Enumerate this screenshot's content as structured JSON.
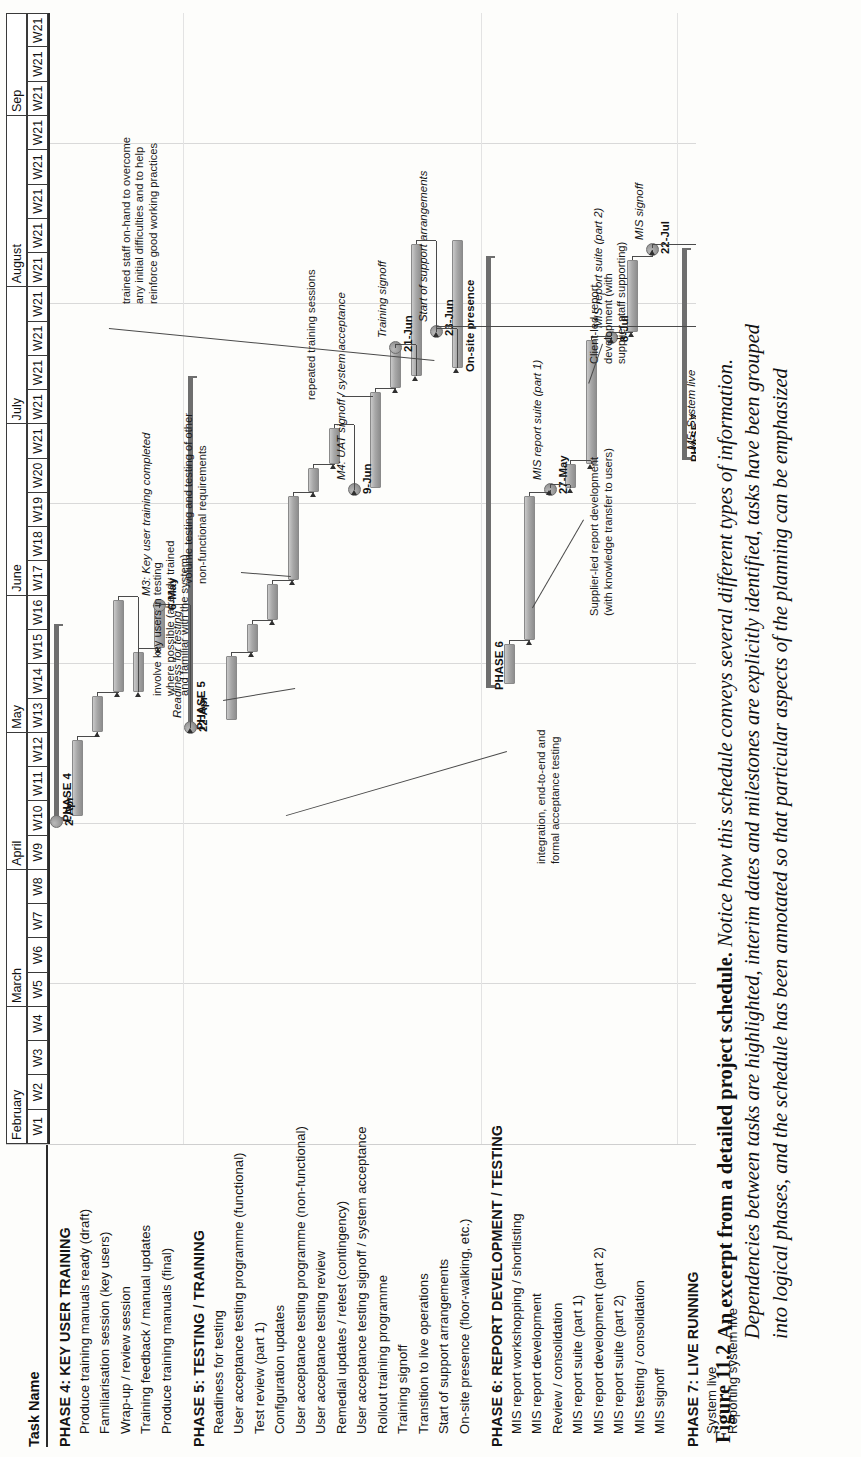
{
  "figure": {
    "number": "Figure 11.2",
    "title": "An excerpt from a detailed project schedule.",
    "body_line1": " Notice how this schedule conveys several different types of information.",
    "body_line2": "Dependencies between tasks are highlighted, interim dates and milestones are explicitly identified, tasks have been grouped",
    "body_line3": "into logical phases, and the schedule has been annotated so that particular aspects of the planning can be emphasized"
  },
  "table": {
    "task_column_header": "Task Name"
  },
  "timeline": {
    "months": [
      {
        "label": "February",
        "weeks": [
          "W1",
          "W2",
          "W3",
          "W4"
        ]
      },
      {
        "label": "March",
        "weeks": [
          "W5",
          "W6",
          "W7",
          "W8"
        ]
      },
      {
        "label": "April",
        "weeks": [
          "W9",
          "W10",
          "W11",
          "W12"
        ]
      },
      {
        "label": "May",
        "weeks": [
          "W13",
          "W14",
          "W15",
          "W16"
        ]
      },
      {
        "label": "June",
        "weeks": [
          "W17",
          "W18",
          "W19",
          "W20",
          "W21"
        ]
      },
      {
        "label": "July",
        "weeks": [
          "W21",
          "W21",
          "W21",
          "W21"
        ]
      },
      {
        "label": "August",
        "weeks": [
          "W21",
          "W21",
          "W21",
          "W21",
          "W21"
        ]
      },
      {
        "label": "Sep",
        "weeks": [
          "W21",
          "W21",
          "W21"
        ]
      }
    ]
  },
  "tasks": [
    {
      "name": "PHASE 4: KEY USER TRAINING",
      "type": "phase"
    },
    {
      "name": "Produce training manuals ready (draft)",
      "type": "task"
    },
    {
      "name": "Familiarisation session (key users)",
      "type": "task"
    },
    {
      "name": "Wrap-up / review session",
      "type": "task"
    },
    {
      "name": "Training feedback / manual updates",
      "type": "task"
    },
    {
      "name": "Produce training manuals (final)",
      "type": "task"
    },
    {
      "name": "PHASE 5: TESTING / TRAINING",
      "type": "phase"
    },
    {
      "name": "Readiness for testing",
      "type": "task"
    },
    {
      "name": "User acceptance testing programme (functional)",
      "type": "task"
    },
    {
      "name": "Test review (part 1)",
      "type": "task"
    },
    {
      "name": "Configuration updates",
      "type": "task"
    },
    {
      "name": "User acceptance testing programme (non-functional)",
      "type": "task"
    },
    {
      "name": "User acceptance testing review",
      "type": "task"
    },
    {
      "name": "Remedial updates / retest (contingency)",
      "type": "task"
    },
    {
      "name": "User acceptance testing signoff / system acceptance",
      "type": "task"
    },
    {
      "name": "Rollout training programme",
      "type": "task"
    },
    {
      "name": "Training signoff",
      "type": "task"
    },
    {
      "name": "Transition to live operations",
      "type": "task"
    },
    {
      "name": "Start of support arrangements",
      "type": "task"
    },
    {
      "name": "On-site presence (floor-walking, etc.)",
      "type": "task"
    },
    {
      "name": "PHASE 6:  REPORT DEVELOPMENT / TESTING",
      "type": "phase"
    },
    {
      "name": "MIS report workshopping / shortlisting",
      "type": "task"
    },
    {
      "name": "MIS report development",
      "type": "task"
    },
    {
      "name": "Review / consolidation",
      "type": "task"
    },
    {
      "name": "MIS report suite (part 1)",
      "type": "task"
    },
    {
      "name": "MIS report development (part 2)",
      "type": "task"
    },
    {
      "name": "MIS report suite (part 2)",
      "type": "task"
    },
    {
      "name": "MIS testing / consolidation",
      "type": "task"
    },
    {
      "name": "MIS signoff",
      "type": "task"
    },
    {
      "name": "PHASE 7: LIVE RUNNING",
      "type": "phase"
    },
    {
      "name": "System live",
      "type": "task"
    },
    {
      "name": "Reporting system live",
      "type": "task"
    }
  ],
  "phase_brackets": [
    {
      "label": "PHASE 4"
    },
    {
      "label": "PHASE 5"
    },
    {
      "label": "PHASE 6"
    },
    {
      "label": "PHASE 7"
    }
  ],
  "milestones": [
    {
      "date": "2-Apr",
      "label": "Draft training manuals ready",
      "style": "italic"
    },
    {
      "date": "6-May",
      "label": "M3: Key user training completed",
      "style": "italic"
    },
    {
      "date": "22-Apr",
      "label": "Readiness for testing",
      "style": "italic"
    },
    {
      "date": "9-Jun",
      "label": "M4: UAT signoff / system acceptance",
      "style": "italic"
    },
    {
      "date": "21-Jun",
      "label": "Training signoff",
      "style": "italic"
    },
    {
      "date": "23-Jun",
      "label": "Start of support arrangements",
      "style": "italic"
    },
    {
      "date": "",
      "label": "On-site presence",
      "style": "bold"
    },
    {
      "date": "27-May",
      "label": "MIS report suite (part 1)",
      "style": "italic"
    },
    {
      "date": "8-Jul",
      "label": "MIS report suite (part 2)",
      "style": "italic"
    },
    {
      "date": "22-Jul",
      "label": "MIS signoff",
      "style": "italic"
    },
    {
      "date": "23-Jun",
      "label": "M5: System live",
      "style": "italic"
    },
    {
      "date": "22-Jul",
      "label": "M6: Reporting system live",
      "style": "italic"
    }
  ],
  "annotations": [
    {
      "text": "integration, end-to-end and\nformal acceptance testing"
    },
    {
      "text": "involve key users in testing\nwhere possible (already trained\nand familiar with the system)"
    },
    {
      "text": "volume testing and testing of other\nnon-functional requirements"
    },
    {
      "text": "repeated training sessions"
    },
    {
      "text": "trained staff on-hand to overcome\nany initial difficulties and to help\nreinforce good working practices"
    },
    {
      "text": "Supplier-led report development\n(with knowledge transfer to users)"
    },
    {
      "text": "Client-led report\ndevelopment (with\nsupplier staff supporting)"
    }
  ]
}
